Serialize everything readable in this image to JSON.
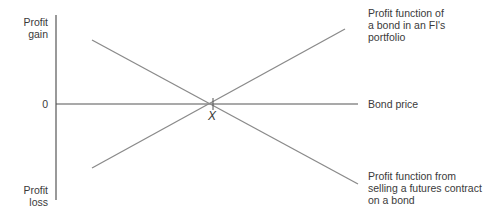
{
  "diagram": {
    "y_axis": {
      "top_label_line1": "Profit",
      "top_label_line2": "gain",
      "bottom_label_line1": "Profit",
      "bottom_label_line2": "loss",
      "zero_label": "0"
    },
    "x_axis": {
      "label": "Bond price",
      "intersection_label": "X"
    },
    "lines": [
      {
        "name": "bond-profit-function",
        "label_line1": "Profit function of",
        "label_line2": "a bond in an FI's",
        "label_line3": "portfolio",
        "slope": "positive"
      },
      {
        "name": "futures-short-profit-function",
        "label_line1": "Profit function from",
        "label_line2": "selling a futures contract",
        "label_line3": "on a bond",
        "slope": "negative"
      }
    ],
    "colors": {
      "axis": "#555555",
      "line": "#8a8a8a",
      "text": "#3a3a3a"
    }
  }
}
